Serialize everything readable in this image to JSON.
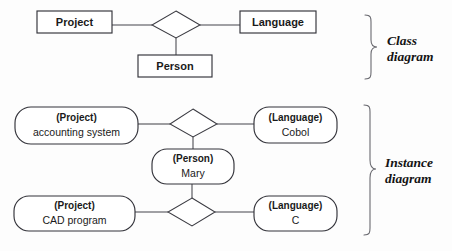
{
  "figure": {
    "background_color": "#fdfdfd",
    "line_color": "#45454c",
    "text_color": "#1a1a1a",
    "brace_color": "#6a6a70"
  },
  "sections": [
    {
      "id": "class",
      "caption_line1": "Class",
      "caption_line2": "diagram"
    },
    {
      "id": "instance",
      "caption_line1": "Instance",
      "caption_line2": "diagram"
    }
  ],
  "class_diagram": {
    "shape": "rectangle",
    "entities": [
      {
        "name": "project-class-box",
        "label": "Project"
      },
      {
        "name": "language-class-box",
        "label": "Language"
      },
      {
        "name": "person-class-box",
        "label": "Person"
      }
    ],
    "relationship": {
      "name": "class-relationship-diamond",
      "label": "",
      "shape": "diamond"
    }
  },
  "instance_diagram": {
    "shape": "rounded-rectangle",
    "entities": [
      {
        "name": "project-instance-accounting",
        "type": "(Project)",
        "value": "accounting system"
      },
      {
        "name": "language-instance-cobol",
        "type": "(Language)",
        "value": "Cobol"
      },
      {
        "name": "person-instance-mary",
        "type": "(Person)",
        "value": "Mary"
      },
      {
        "name": "project-instance-cad",
        "type": "(Project)",
        "value": "CAD program"
      },
      {
        "name": "language-instance-c",
        "type": "(Language)",
        "value": "C"
      }
    ],
    "relationships": [
      {
        "name": "instance-relationship-diamond-top",
        "label": "",
        "shape": "diamond"
      },
      {
        "name": "instance-relationship-diamond-bottom",
        "label": "",
        "shape": "diamond"
      }
    ]
  }
}
